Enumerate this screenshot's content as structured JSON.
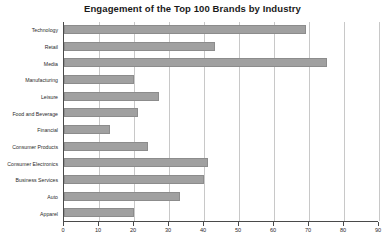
{
  "chart_data": {
    "type": "bar",
    "orientation": "horizontal",
    "title": "Engagement of the Top 100 Brands by Industry",
    "xlabel": "",
    "ylabel": "",
    "categories": [
      "Technology",
      "Retail",
      "Media",
      "Manufacturing",
      "Leisure",
      "Food and Beverage",
      "Financial",
      "Consumer Products",
      "Consumer Electronics",
      "Business Services",
      "Auto",
      "Apparel"
    ],
    "values": [
      69,
      43,
      75,
      20,
      27,
      21,
      13,
      24,
      41,
      40,
      33,
      20
    ],
    "xlim": [
      0,
      90
    ],
    "xticks": [
      0,
      10,
      20,
      30,
      40,
      50,
      60,
      70,
      80,
      90
    ],
    "xtick_labels": [
      "0",
      "10",
      "20",
      "30",
      "40",
      "50",
      "60",
      "70",
      "80",
      "90"
    ],
    "grid": "vertical",
    "legend": "none",
    "bar_color": "#a0a0a0",
    "bar_border_color": "#8c8c8c",
    "gridline_color": "#c8c8c8",
    "axis_color": "#4a4a4a",
    "background": "#ffffff"
  }
}
